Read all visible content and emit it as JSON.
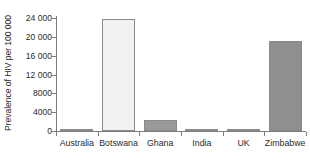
{
  "chart_data": {
    "type": "bar",
    "title": "",
    "xlabel": "",
    "ylabel": "Prevalence of HIV per 100 000",
    "categories": [
      "Australia",
      "Botswana",
      "Ghana",
      "India",
      "UK",
      "Zimbabwe"
    ],
    "values": [
      120,
      23800,
      2300,
      450,
      160,
      19100
    ],
    "ylim": [
      0,
      24000
    ],
    "ytick_labels": [
      "0",
      "4000",
      "8000",
      "12 000",
      "16 000",
      "20 000",
      "24 000"
    ],
    "ytick_values": [
      0,
      4000,
      8000,
      12000,
      16000,
      20000,
      24000
    ],
    "grid": false,
    "legend": "none",
    "bar_colors": [
      "#f2f2f2",
      "#f2f2f2",
      "#9a9a9a",
      "#dcdcdc",
      "#f2f2f2",
      "#8f8f8f"
    ],
    "bar_border_color": "#8a8a8a",
    "axis_color": "#7d7d7d",
    "text_color": "#2b2b2b",
    "background": "#ffffff"
  }
}
